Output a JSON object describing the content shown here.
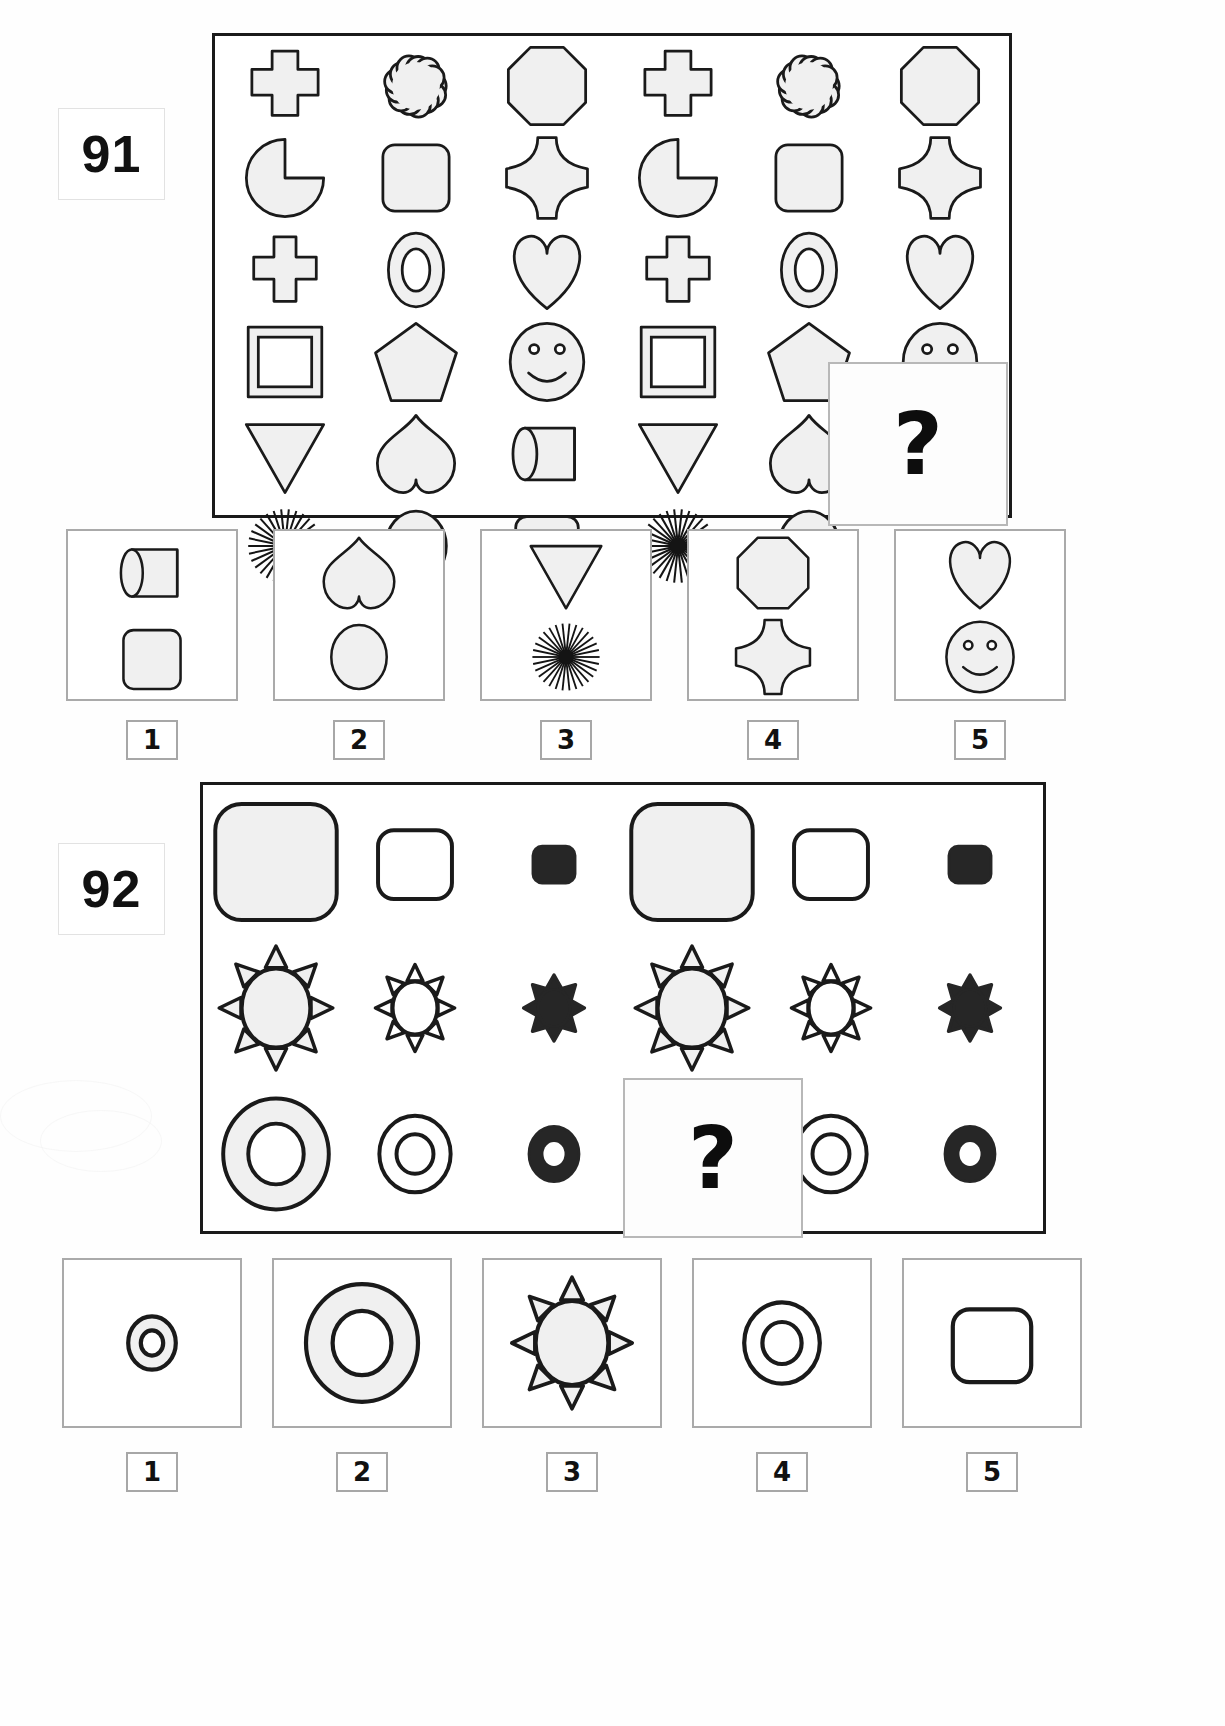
{
  "page": {
    "width": 1225,
    "height": 1726,
    "background": "#ffffff",
    "ink": "#1a1a1a",
    "fill": "#f0f0f0"
  },
  "puzzles": [
    {
      "id": "puzzle-91",
      "number": "91",
      "frame": {
        "x": 212,
        "y": 33,
        "w": 800,
        "h": 485
      },
      "grid": {
        "rows": 6,
        "cols": 6
      },
      "matrix_shapes": [
        [
          "cross-plus",
          "cloud",
          "octagon",
          "cross-plus",
          "cloud",
          "octagon"
        ],
        [
          "pacman",
          "rounded-square",
          "four-point-star",
          "pacman",
          "rounded-square",
          "four-point-star"
        ],
        [
          "cross",
          "ring-oval",
          "heart",
          "cross",
          "ring-oval",
          "heart"
        ],
        [
          "double-square",
          "pentagon",
          "smiley",
          "double-square",
          "pentagon",
          "smiley"
        ],
        [
          "triangle-down",
          "heart-round",
          "cylinder",
          "triangle-down",
          "heart-round",
          "missing"
        ],
        [
          "sunburst",
          "circle",
          "rounded-rect",
          "sunburst",
          "circle",
          "missing"
        ]
      ],
      "question_box": {
        "x": 828,
        "y": 362,
        "w": 176,
        "h": 160,
        "mark": "?"
      },
      "options": [
        {
          "label": "1",
          "shapes": [
            "cylinder",
            "rounded-rect"
          ]
        },
        {
          "label": "2",
          "shapes": [
            "heart-round",
            "circle"
          ]
        },
        {
          "label": "3",
          "shapes": [
            "triangle-down",
            "sunburst"
          ]
        },
        {
          "label": "4",
          "shapes": [
            "octagon",
            "four-point-star"
          ]
        },
        {
          "label": "5",
          "shapes": [
            "heart",
            "smiley"
          ]
        }
      ]
    },
    {
      "id": "puzzle-92",
      "number": "92",
      "frame": {
        "x": 200,
        "y": 782,
        "w": 846,
        "h": 452
      },
      "grid": {
        "rows": 3,
        "cols": 6
      },
      "matrix_shapes": [
        [
          "rounded-square-big-grey",
          "rounded-square-mid-white",
          "rounded-square-small-black",
          "rounded-square-big-grey",
          "rounded-square-mid-white",
          "rounded-square-small-black"
        ],
        [
          "sun-big-grey",
          "sun-mid-white",
          "sun-small-black",
          "sun-big-grey",
          "sun-mid-white",
          "sun-small-black"
        ],
        [
          "donut-big-grey",
          "donut-mid-white",
          "donut-small-black",
          "missing",
          "donut-mid-white",
          "donut-small-black"
        ]
      ],
      "question_box": {
        "x": 623,
        "y": 1078,
        "w": 176,
        "h": 156,
        "mark": "?"
      },
      "options": [
        {
          "label": "1",
          "shapes": [
            "donut-tiny-grey"
          ]
        },
        {
          "label": "2",
          "shapes": [
            "donut-big-grey"
          ]
        },
        {
          "label": "3",
          "shapes": [
            "sun-big-grey"
          ]
        },
        {
          "label": "4",
          "shapes": [
            "donut-mid-white"
          ]
        },
        {
          "label": "5",
          "shapes": [
            "rounded-square-mid-white"
          ]
        }
      ]
    }
  ],
  "option_labels": [
    "1",
    "2",
    "3",
    "4",
    "5"
  ]
}
